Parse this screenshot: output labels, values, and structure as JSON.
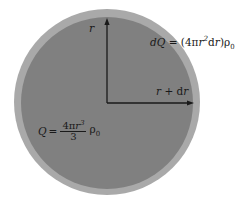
{
  "figure": {
    "background_color": "#ffffff",
    "width": 246,
    "height": 206
  },
  "shapes": {
    "outer_sphere": {
      "name": "outer-shell-circle",
      "fill_color": "#a9a9a9",
      "center_x": 107,
      "center_y": 102,
      "radius": 93,
      "meaning": "sphere of radius r + dr"
    },
    "inner_sphere": {
      "name": "inner-sphere-circle",
      "fill_color": "#808080",
      "center_x": 107,
      "center_y": 103,
      "radius": 86,
      "meaning": "sphere of radius r"
    }
  },
  "arrows": {
    "vertical_radius": {
      "name": "radius-arrow-vertical",
      "from_x": 107,
      "from_y": 103,
      "to_x": 107,
      "to_y": 20,
      "color": "#1a1a1a",
      "label": "r"
    },
    "horizontal_radius": {
      "name": "radius-arrow-horizontal",
      "from_x": 107,
      "from_y": 103,
      "to_x": 194,
      "to_y": 103,
      "color": "#1a1a1a",
      "label": "r + dr"
    }
  },
  "labels": {
    "radius_inner": {
      "text": "r",
      "parts": {
        "var": "r"
      }
    },
    "radius_outer": {
      "text": "r + dr",
      "parts": {
        "var": "r",
        "plus": "+",
        "diff": "d",
        "var2": "r"
      }
    },
    "shell_charge": {
      "text": "dQ = (4πr²dr)ρ₀",
      "parts": {
        "d": "d",
        "Q": "Q",
        "equals": "=",
        "open": "(4π",
        "r": "r",
        "exp": "2",
        "dr": "d",
        "r2": "r",
        "close": ")",
        "rho": "ρ",
        "rho_sub": "0"
      }
    },
    "total_charge": {
      "text": "Q = (4πr³/3)ρ₀",
      "parts": {
        "Q": "Q",
        "equals": "=",
        "numerator_pre": "4π",
        "numerator_var": "r",
        "numerator_exp": "3",
        "denominator": "3",
        "rho": "ρ",
        "rho_sub": "0"
      }
    }
  }
}
